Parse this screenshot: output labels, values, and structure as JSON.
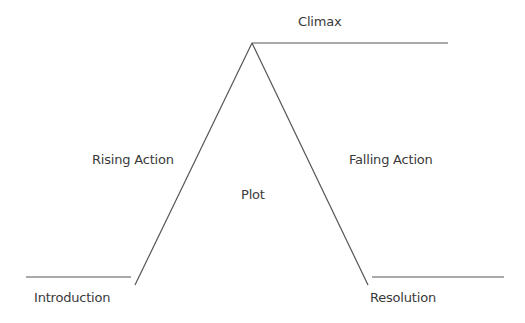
{
  "diagram": {
    "title": "Plot",
    "line_color": "#555555",
    "labels": {
      "climax": "Climax",
      "rising_action": "Rising Action",
      "falling_action": "Falling Action",
      "plot": "Plot",
      "introduction": "Introduction",
      "resolution": "Resolution"
    },
    "stages": [
      "Introduction",
      "Rising Action",
      "Climax",
      "Falling Action",
      "Resolution"
    ]
  }
}
